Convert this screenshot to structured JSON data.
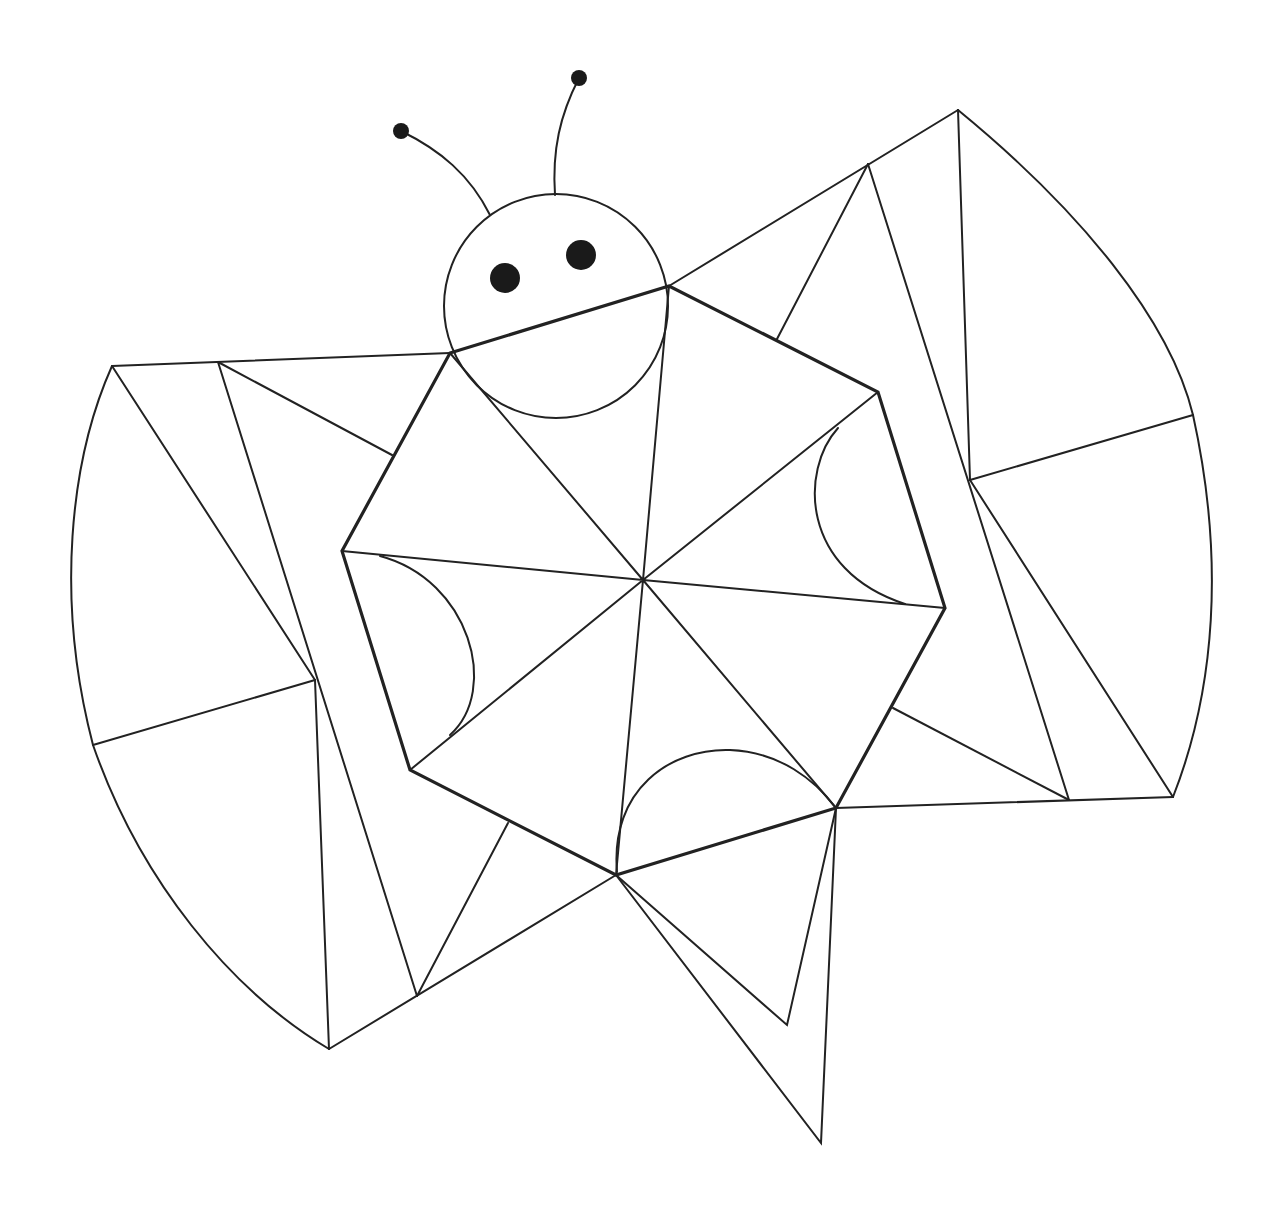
{
  "colors": {
    "stroke": "#222222",
    "fill": "#1a1a1a",
    "background": "#ffffff"
  },
  "figure": {
    "head": {
      "cx": 556,
      "cy": 306,
      "r": 112
    },
    "eyes": [
      {
        "cx": 505,
        "cy": 278,
        "r": 15
      },
      {
        "cx": 581,
        "cy": 255,
        "r": 15
      }
    ],
    "antennae_tips": [
      {
        "cx": 401,
        "cy": 131,
        "r": 8
      },
      {
        "cx": 579,
        "cy": 78,
        "r": 8
      }
    ],
    "body_center": {
      "x": 643,
      "y": 580
    },
    "hexagon": [
      [
        450,
        353
      ],
      [
        669,
        286
      ],
      [
        878,
        392
      ],
      [
        945,
        608
      ],
      [
        836,
        808
      ],
      [
        616,
        875
      ],
      [
        410,
        770
      ],
      [
        342,
        551
      ]
    ]
  }
}
